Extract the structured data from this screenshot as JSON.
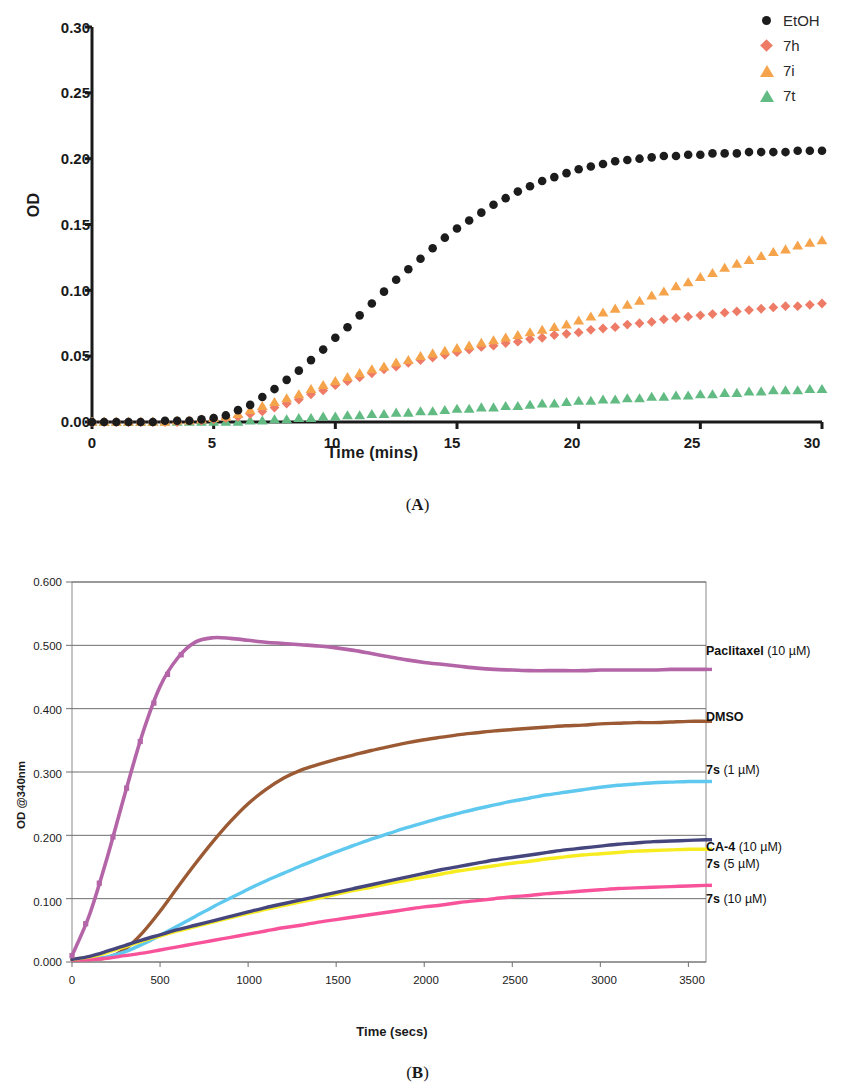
{
  "figure": {
    "panel_a_caption": "(A)",
    "panel_b_caption": "(B)"
  },
  "chart_data": [
    {
      "panel": "A",
      "type": "scatter",
      "title": "",
      "xlabel": "Time (mins)",
      "ylabel": "OD",
      "xlim": [
        0,
        30
      ],
      "ylim": [
        0,
        0.3
      ],
      "xticks": [
        "0",
        "5",
        "10",
        "15",
        "20",
        "25",
        "30"
      ],
      "yticks": [
        "0.00",
        "0.05",
        "0.10",
        "0.15",
        "0.20",
        "0.25",
        "0.30"
      ],
      "grid": false,
      "legend_position": "top-right",
      "x": [
        0,
        0.5,
        1,
        1.5,
        2,
        2.5,
        3,
        3.5,
        4,
        4.5,
        5,
        5.5,
        6,
        6.5,
        7,
        7.5,
        8,
        8.5,
        9,
        9.5,
        10,
        10.5,
        11,
        11.5,
        12,
        12.5,
        13,
        13.5,
        14,
        14.5,
        15,
        15.5,
        16,
        16.5,
        17,
        17.5,
        18,
        18.5,
        19,
        19.5,
        20,
        20.5,
        21,
        21.5,
        22,
        22.5,
        23,
        23.5,
        24,
        24.5,
        25,
        25.5,
        26,
        26.5,
        27,
        27.5,
        28,
        28.5,
        29,
        29.5,
        30
      ],
      "series": [
        {
          "name": "EtOH",
          "marker": "circle",
          "color": "#1c1c1c",
          "values": [
            0.0,
            0.0,
            0.0,
            0.0,
            0.0,
            0.0,
            0.001,
            0.001,
            0.001,
            0.002,
            0.003,
            0.005,
            0.009,
            0.013,
            0.019,
            0.025,
            0.032,
            0.039,
            0.047,
            0.055,
            0.064,
            0.072,
            0.081,
            0.09,
            0.099,
            0.108,
            0.116,
            0.124,
            0.132,
            0.14,
            0.147,
            0.153,
            0.159,
            0.165,
            0.17,
            0.175,
            0.179,
            0.183,
            0.186,
            0.189,
            0.192,
            0.194,
            0.196,
            0.198,
            0.199,
            0.2,
            0.201,
            0.202,
            0.202,
            0.203,
            0.203,
            0.204,
            0.204,
            0.204,
            0.205,
            0.205,
            0.205,
            0.205,
            0.206,
            0.206,
            0.206
          ]
        },
        {
          "name": "7h",
          "marker": "diamond",
          "color": "#ee7b66",
          "values": [
            0.0,
            0.0,
            0.0,
            0.0,
            0.0,
            0.0,
            0.0,
            0.0,
            0.001,
            0.001,
            0.002,
            0.003,
            0.004,
            0.006,
            0.008,
            0.011,
            0.014,
            0.017,
            0.021,
            0.024,
            0.028,
            0.031,
            0.034,
            0.037,
            0.04,
            0.042,
            0.045,
            0.047,
            0.049,
            0.051,
            0.053,
            0.055,
            0.057,
            0.058,
            0.06,
            0.061,
            0.063,
            0.064,
            0.066,
            0.067,
            0.068,
            0.07,
            0.071,
            0.072,
            0.074,
            0.075,
            0.076,
            0.078,
            0.079,
            0.08,
            0.081,
            0.082,
            0.083,
            0.084,
            0.085,
            0.086,
            0.087,
            0.088,
            0.088,
            0.089,
            0.09
          ]
        },
        {
          "name": "7i",
          "marker": "triangle",
          "color": "#f5a44c",
          "values": [
            0.0,
            0.0,
            0.0,
            0.0,
            0.0,
            0.0,
            0.0,
            0.001,
            0.001,
            0.002,
            0.003,
            0.004,
            0.006,
            0.009,
            0.012,
            0.015,
            0.018,
            0.021,
            0.025,
            0.028,
            0.031,
            0.034,
            0.037,
            0.04,
            0.042,
            0.045,
            0.047,
            0.05,
            0.052,
            0.054,
            0.056,
            0.058,
            0.06,
            0.062,
            0.064,
            0.066,
            0.068,
            0.07,
            0.072,
            0.074,
            0.077,
            0.08,
            0.083,
            0.086,
            0.089,
            0.092,
            0.096,
            0.099,
            0.103,
            0.106,
            0.11,
            0.113,
            0.117,
            0.12,
            0.123,
            0.126,
            0.129,
            0.131,
            0.134,
            0.136,
            0.138
          ]
        },
        {
          "name": "7t",
          "marker": "triangle",
          "color": "#62bb83",
          "values": [
            0.0,
            0.0,
            0.0,
            0.0,
            0.0,
            0.0,
            0.0,
            0.0,
            0.0,
            0.0,
            0.0,
            0.0,
            0.0,
            0.001,
            0.001,
            0.002,
            0.002,
            0.003,
            0.003,
            0.004,
            0.004,
            0.005,
            0.005,
            0.006,
            0.006,
            0.007,
            0.007,
            0.008,
            0.008,
            0.009,
            0.01,
            0.01,
            0.011,
            0.011,
            0.012,
            0.012,
            0.013,
            0.014,
            0.014,
            0.015,
            0.016,
            0.016,
            0.017,
            0.017,
            0.018,
            0.018,
            0.019,
            0.019,
            0.02,
            0.02,
            0.021,
            0.021,
            0.022,
            0.022,
            0.023,
            0.023,
            0.024,
            0.024,
            0.024,
            0.025,
            0.025
          ]
        }
      ]
    },
    {
      "panel": "B",
      "type": "line",
      "title": "",
      "xlabel": "Time (secs)",
      "ylabel": "OD @340nm",
      "xlim": [
        0,
        3600
      ],
      "ylim": [
        0,
        0.6
      ],
      "xticks": [
        "0",
        "500",
        "1000",
        "1500",
        "2000",
        "2500",
        "3000",
        "3500"
      ],
      "yticks": [
        "0.000",
        "0.100",
        "0.200",
        "0.300",
        "0.400",
        "0.500",
        "0.600"
      ],
      "grid": true,
      "legend_position": "right-inline",
      "x": [
        0,
        100,
        200,
        300,
        400,
        500,
        600,
        700,
        800,
        900,
        1000,
        1100,
        1200,
        1300,
        1400,
        1500,
        1600,
        1700,
        1800,
        1900,
        2000,
        2100,
        2200,
        2300,
        2400,
        2500,
        2600,
        2700,
        2800,
        2900,
        3000,
        3100,
        3200,
        3300,
        3400,
        3500,
        3600
      ],
      "series": [
        {
          "name": "Paclitaxel (10 µM)",
          "label_bold": "Paclitaxel",
          "label_rest": " (10 µM)",
          "color": "#b465a8",
          "values": [
            0.01,
            0.075,
            0.165,
            0.265,
            0.36,
            0.435,
            0.48,
            0.505,
            0.512,
            0.511,
            0.508,
            0.505,
            0.503,
            0.501,
            0.499,
            0.496,
            0.492,
            0.487,
            0.482,
            0.477,
            0.473,
            0.47,
            0.467,
            0.464,
            0.462,
            0.461,
            0.46,
            0.46,
            0.46,
            0.46,
            0.461,
            0.461,
            0.461,
            0.461,
            0.462,
            0.462,
            0.462
          ]
        },
        {
          "name": "DMSO",
          "label_bold": "DMSO",
          "label_rest": "",
          "color": "#9b5a33",
          "values": [
            0.004,
            0.004,
            0.007,
            0.02,
            0.046,
            0.08,
            0.118,
            0.155,
            0.19,
            0.222,
            0.25,
            0.272,
            0.29,
            0.303,
            0.312,
            0.32,
            0.327,
            0.334,
            0.34,
            0.346,
            0.351,
            0.355,
            0.359,
            0.362,
            0.365,
            0.367,
            0.369,
            0.371,
            0.373,
            0.374,
            0.376,
            0.377,
            0.378,
            0.378,
            0.379,
            0.38,
            0.38
          ]
        },
        {
          "name": "7s (1 µM)",
          "label_bold": "7s",
          "label_rest": " (1 µM)",
          "color": "#5ec8ef",
          "values": [
            0.004,
            0.005,
            0.008,
            0.016,
            0.028,
            0.042,
            0.057,
            0.072,
            0.087,
            0.101,
            0.115,
            0.128,
            0.14,
            0.152,
            0.163,
            0.174,
            0.184,
            0.194,
            0.203,
            0.212,
            0.22,
            0.228,
            0.235,
            0.242,
            0.248,
            0.254,
            0.259,
            0.264,
            0.268,
            0.272,
            0.276,
            0.279,
            0.281,
            0.283,
            0.284,
            0.285,
            0.285
          ]
        },
        {
          "name": "CA-4 (10 µM)",
          "label_bold": "CA-4",
          "label_rest": " (10 µM)",
          "color": "#46467e",
          "values": [
            0.004,
            0.009,
            0.017,
            0.026,
            0.035,
            0.043,
            0.051,
            0.058,
            0.065,
            0.072,
            0.079,
            0.086,
            0.092,
            0.098,
            0.104,
            0.11,
            0.116,
            0.122,
            0.128,
            0.134,
            0.14,
            0.146,
            0.151,
            0.156,
            0.161,
            0.165,
            0.169,
            0.173,
            0.177,
            0.18,
            0.183,
            0.186,
            0.188,
            0.19,
            0.191,
            0.192,
            0.193
          ]
        },
        {
          "name": "7s (5 µM)",
          "label_bold": "7s",
          "label_rest": " (5 µM)",
          "color": "#f7ec20",
          "values": [
            0.004,
            0.008,
            0.015,
            0.024,
            0.033,
            0.041,
            0.049,
            0.056,
            0.063,
            0.07,
            0.077,
            0.083,
            0.089,
            0.095,
            0.101,
            0.107,
            0.113,
            0.118,
            0.124,
            0.129,
            0.134,
            0.139,
            0.144,
            0.148,
            0.152,
            0.156,
            0.159,
            0.163,
            0.166,
            0.169,
            0.171,
            0.173,
            0.175,
            0.176,
            0.177,
            0.178,
            0.178
          ]
        },
        {
          "name": "7s (10 µM)",
          "label_bold": "7s",
          "label_rest": " (10 µM)",
          "color": "#f8539a",
          "values": [
            0.003,
            0.004,
            0.006,
            0.01,
            0.014,
            0.019,
            0.024,
            0.029,
            0.034,
            0.039,
            0.044,
            0.049,
            0.054,
            0.058,
            0.063,
            0.067,
            0.071,
            0.075,
            0.079,
            0.083,
            0.087,
            0.09,
            0.094,
            0.097,
            0.1,
            0.103,
            0.105,
            0.108,
            0.11,
            0.112,
            0.114,
            0.116,
            0.117,
            0.118,
            0.119,
            0.12,
            0.121
          ]
        }
      ]
    }
  ]
}
